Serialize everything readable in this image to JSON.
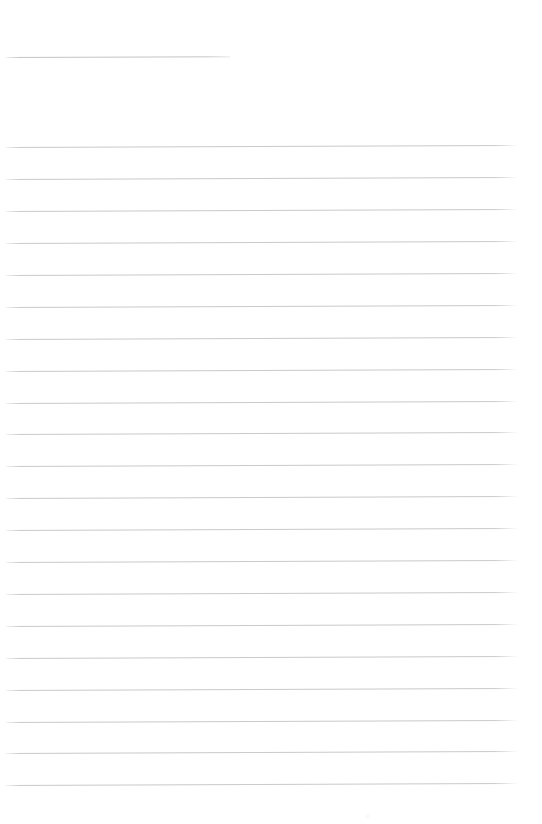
{
  "page": {
    "kind": "ruled-paper",
    "width": 542,
    "height": 824,
    "background_color": "#ffffff",
    "content_text": "",
    "note": "blank ruled page; no text content rendered"
  },
  "title_rule": {
    "label": "",
    "x": 6,
    "y": 57,
    "width": 224,
    "color": "#c4c4c9",
    "thickness": 1,
    "slant_deg": -0.18
  },
  "body_rules": {
    "color": "#c9c9ce",
    "thickness": 1,
    "x": 6,
    "width": 512,
    "spacing": 31.9,
    "count": 21,
    "slant_deg": -0.22,
    "lines": [
      {
        "index": 1,
        "y": 147,
        "text": ""
      },
      {
        "index": 2,
        "y": 179,
        "text": ""
      },
      {
        "index": 3,
        "y": 211,
        "text": ""
      },
      {
        "index": 4,
        "y": 243,
        "text": ""
      },
      {
        "index": 5,
        "y": 275,
        "text": ""
      },
      {
        "index": 6,
        "y": 307,
        "text": ""
      },
      {
        "index": 7,
        "y": 339,
        "text": ""
      },
      {
        "index": 8,
        "y": 371,
        "text": ""
      },
      {
        "index": 9,
        "y": 403,
        "text": ""
      },
      {
        "index": 10,
        "y": 434,
        "text": ""
      },
      {
        "index": 11,
        "y": 466,
        "text": ""
      },
      {
        "index": 12,
        "y": 498,
        "text": ""
      },
      {
        "index": 13,
        "y": 530,
        "text": ""
      },
      {
        "index": 14,
        "y": 562,
        "text": ""
      },
      {
        "index": 15,
        "y": 594,
        "text": ""
      },
      {
        "index": 16,
        "y": 626,
        "text": ""
      },
      {
        "index": 17,
        "y": 658,
        "text": ""
      },
      {
        "index": 18,
        "y": 690,
        "text": ""
      },
      {
        "index": 19,
        "y": 722,
        "text": ""
      },
      {
        "index": 20,
        "y": 753,
        "text": ""
      },
      {
        "index": 21,
        "y": 785,
        "text": ""
      }
    ]
  },
  "artifacts": [
    {
      "name": "scan-speck",
      "x": 365,
      "y": 814,
      "color": "#fafafb"
    }
  ]
}
